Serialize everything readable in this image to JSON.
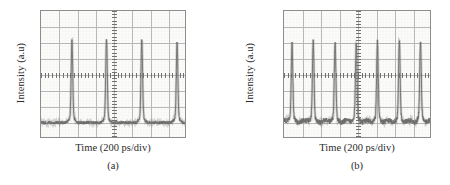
{
  "figure": {
    "width": 450,
    "height": 185,
    "background": "#ffffff",
    "trace_color": "#6d6d6d",
    "grid_color": "#b9b9b9",
    "frame_color": "#8d8d8d",
    "text_color": "#2b2b2b"
  },
  "panels": [
    {
      "id": "a",
      "caption": "(a)",
      "xlabel": "Time (200 ps/div)",
      "ylabel": "Intensity (a.u)"
    },
    {
      "id": "b",
      "caption": "(b)",
      "xlabel": "Time (200 ps/div)",
      "ylabel": "Intensity (a.u)"
    }
  ],
  "chart_data": [
    {
      "type": "line",
      "panel": "a",
      "title": "(a)",
      "xlabel": "Time (200 ps/div)",
      "ylabel": "Intensity (a.u)",
      "xunit": "ps",
      "x_per_div": 200,
      "divisions_x": 8,
      "divisions_y": 8,
      "grid": true,
      "axis_ticks": true,
      "tick_labels_x": [],
      "tick_labels_y": [],
      "legend": null,
      "baseline_frac": 0.885,
      "noise_amplitude_frac": 0.012,
      "description": "Oscilloscope pulse train, low repetition rate; four sharp pulses across the 8-division window.",
      "peaks": [
        {
          "x_frac": 0.215,
          "height_frac": 0.6
        },
        {
          "x_frac": 0.455,
          "height_frac": 0.605
        },
        {
          "x_frac": 0.7,
          "height_frac": 0.61
        },
        {
          "x_frac": 0.945,
          "height_frac": 0.585
        }
      ],
      "pulse_period_divs": 1.95,
      "pulse_count": 4
    },
    {
      "type": "line",
      "panel": "b",
      "title": "(b)",
      "xlabel": "Time (200 ps/div)",
      "ylabel": "Intensity (a.u)",
      "xunit": "ps",
      "x_per_div": 200,
      "divisions_x": 8,
      "divisions_y": 8,
      "grid": true,
      "axis_ticks": true,
      "tick_labels_x": [],
      "tick_labels_y": [],
      "legend": null,
      "baseline_frac": 0.885,
      "noise_amplitude_frac": 0.02,
      "description": "Oscilloscope pulse train, higher repetition rate; seven sharp pulses across the 8-division window with small secondary humps between pulses.",
      "peaks": [
        {
          "x_frac": 0.055,
          "height_frac": 0.575
        },
        {
          "x_frac": 0.2,
          "height_frac": 0.595
        },
        {
          "x_frac": 0.35,
          "height_frac": 0.585
        },
        {
          "x_frac": 0.495,
          "height_frac": 0.58
        },
        {
          "x_frac": 0.64,
          "height_frac": 0.59
        },
        {
          "x_frac": 0.79,
          "height_frac": 0.595
        },
        {
          "x_frac": 0.935,
          "height_frac": 0.58
        }
      ],
      "pulse_period_divs": 1.17,
      "pulse_count": 7
    }
  ]
}
